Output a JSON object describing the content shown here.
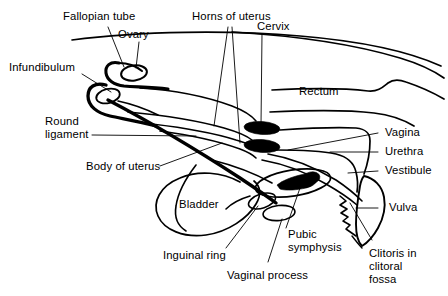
{
  "figure": {
    "domain": "anatomical-diagram",
    "width": 448,
    "height": 296,
    "background_color": "#ffffff",
    "line_color": "#000000",
    "text_color": "#000000"
  },
  "labels": {
    "fallopian_tube": "Fallopian tube",
    "ovary": "Ovary",
    "horns_of_uterus": "Horns of uterus",
    "cervix": "Cervix",
    "infundibulum": "Infundibulum",
    "rectum": "Rectum",
    "round_ligament": "Round\nligament",
    "vagina": "Vagina",
    "urethra": "Urethra",
    "body_of_uterus": "Body of uterus",
    "vestibule": "Vestibule",
    "bladder": "Bladder",
    "vulva": "Vulva",
    "pubic_symphysis": "Pubic\nsymphysis",
    "inguinal_ring": "Inguinal ring",
    "vaginal_process": "Vaginal process",
    "clitoris": "Clitoris in\nclitoral\nfossa"
  },
  "structures": [
    {
      "name": "dorsal-body-wall",
      "kind": "outline",
      "filled": false
    },
    {
      "name": "fallopian-tube",
      "kind": "tube",
      "filled": false
    },
    {
      "name": "ovary",
      "kind": "oval",
      "filled": false
    },
    {
      "name": "infundibulum",
      "kind": "hook",
      "filled": false
    },
    {
      "name": "horns-of-uterus",
      "kind": "tube",
      "filled": false
    },
    {
      "name": "cervix",
      "kind": "ellipse",
      "filled": true
    },
    {
      "name": "rectum",
      "kind": "tube",
      "filled": false
    },
    {
      "name": "vagina",
      "kind": "tube",
      "filled": false
    },
    {
      "name": "urethra",
      "kind": "tube",
      "filled": false
    },
    {
      "name": "vestibule",
      "kind": "tube",
      "filled": false
    },
    {
      "name": "bladder",
      "kind": "oval",
      "filled": false
    },
    {
      "name": "body-of-uterus",
      "kind": "tube",
      "filled": false
    },
    {
      "name": "round-ligament",
      "kind": "thick-line",
      "filled": false
    },
    {
      "name": "pubic-symphysis",
      "kind": "oval",
      "filled": true
    },
    {
      "name": "inguinal-ring",
      "kind": "small-oval",
      "filled": false
    },
    {
      "name": "vaginal-process",
      "kind": "small-oval",
      "filled": false
    },
    {
      "name": "vulva",
      "kind": "bulb",
      "filled": false
    },
    {
      "name": "clitoris",
      "kind": "zigzag",
      "filled": false
    }
  ]
}
